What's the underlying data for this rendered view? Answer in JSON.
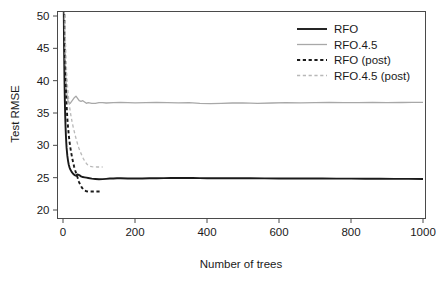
{
  "chart_data": {
    "type": "line",
    "title": "",
    "xlabel": "Number of trees",
    "ylabel": "Test RMSE",
    "xlim": [
      0,
      1000
    ],
    "ylim": [
      20,
      51
    ],
    "xticks": [
      0,
      200,
      400,
      600,
      800,
      1000
    ],
    "yticks": [
      20,
      25,
      30,
      35,
      40,
      45,
      50
    ],
    "xtick_labels": [
      "0",
      "200",
      "400",
      "600",
      "800",
      "1000"
    ],
    "ytick_labels": [
      "20",
      "25",
      "30",
      "35",
      "40",
      "45",
      "50"
    ],
    "grid": false,
    "legend_position": "top-right",
    "series": [
      {
        "name": "RFO",
        "color": "#1a1a1a",
        "style": "solid",
        "width": 1.9,
        "x": [
          1,
          2,
          3,
          4,
          5,
          6,
          7,
          8,
          9,
          10,
          12,
          14,
          16,
          18,
          20,
          24,
          28,
          32,
          36,
          40,
          45,
          50,
          55,
          60,
          65,
          70,
          80,
          90,
          100,
          110,
          120,
          130,
          140,
          150,
          160,
          180,
          200,
          220,
          240,
          260,
          280,
          300,
          320,
          340,
          360,
          380,
          400,
          440,
          480,
          520,
          560,
          600,
          640,
          680,
          720,
          760,
          800,
          840,
          880,
          920,
          960,
          1000
        ],
        "y": [
          62.5,
          52.0,
          45.0,
          40.5,
          37.2,
          34.8,
          33.0,
          31.6,
          30.5,
          29.6,
          28.4,
          27.6,
          27.0,
          26.6,
          26.3,
          25.9,
          25.6,
          25.4,
          25.3,
          25.5,
          25.4,
          25.2,
          25.1,
          25.05,
          25.0,
          24.95,
          24.85,
          24.8,
          24.75,
          24.78,
          24.82,
          24.86,
          24.88,
          24.9,
          24.9,
          24.88,
          24.87,
          24.88,
          24.9,
          24.92,
          24.93,
          24.95,
          24.96,
          24.95,
          24.94,
          24.93,
          24.92,
          24.91,
          24.9,
          24.9,
          24.89,
          24.88,
          24.88,
          24.87,
          24.86,
          24.85,
          24.85,
          24.84,
          24.83,
          24.82,
          24.81,
          24.8
        ]
      },
      {
        "name": "RFO.4.5",
        "color": "#a8a8a8",
        "style": "solid",
        "width": 1.3,
        "x": [
          1,
          2,
          3,
          4,
          5,
          6,
          7,
          8,
          9,
          10,
          12,
          14,
          16,
          18,
          20,
          24,
          28,
          32,
          36,
          40,
          45,
          50,
          55,
          60,
          65,
          70,
          80,
          90,
          100,
          110,
          120,
          140,
          160,
          180,
          200,
          230,
          260,
          290,
          320,
          350,
          380,
          410,
          440,
          470,
          500,
          540,
          580,
          620,
          660,
          700,
          740,
          780,
          820,
          860,
          900,
          940,
          970,
          1000
        ],
        "y": [
          75.0,
          63.0,
          55.0,
          49.5,
          46.0,
          43.5,
          41.6,
          40.2,
          39.2,
          38.4,
          37.4,
          36.9,
          36.6,
          36.5,
          36.5,
          36.8,
          37.1,
          37.4,
          37.6,
          37.3,
          36.9,
          36.8,
          36.9,
          36.7,
          36.5,
          36.6,
          36.5,
          36.5,
          36.6,
          36.6,
          36.55,
          36.6,
          36.62,
          36.6,
          36.58,
          36.6,
          36.62,
          36.6,
          36.58,
          36.6,
          36.5,
          36.45,
          36.5,
          36.55,
          36.58,
          36.5,
          36.55,
          36.6,
          36.58,
          36.6,
          36.62,
          36.6,
          36.6,
          36.62,
          36.6,
          36.62,
          36.63,
          36.65
        ]
      },
      {
        "name": "RFO (post)",
        "color": "#1a1a1a",
        "style": "dashed",
        "width": 1.9,
        "x": [
          1,
          2,
          3,
          4,
          5,
          6,
          7,
          8,
          9,
          10,
          12,
          14,
          16,
          18,
          20,
          22,
          25,
          28,
          31,
          34,
          37,
          40,
          44,
          48,
          52,
          56,
          60,
          65,
          70,
          75,
          80,
          85,
          90,
          95,
          100,
          105
        ],
        "y": [
          70.0,
          60.0,
          53.0,
          48.5,
          45.2,
          42.6,
          40.5,
          38.8,
          37.4,
          36.2,
          34.2,
          32.8,
          31.6,
          30.6,
          29.8,
          29.1,
          28.2,
          27.4,
          26.7,
          26.1,
          25.6,
          25.1,
          24.4,
          23.9,
          23.5,
          23.2,
          23.0,
          22.9,
          22.85,
          22.85,
          22.85,
          22.85,
          22.86,
          22.86,
          22.86,
          22.86
        ]
      },
      {
        "name": "RFO.4.5 (post)",
        "color": "#b8b8b8",
        "style": "dashed",
        "width": 1.3,
        "x": [
          1,
          2,
          3,
          4,
          5,
          6,
          7,
          8,
          9,
          10,
          12,
          14,
          16,
          18,
          20,
          22,
          25,
          28,
          31,
          34,
          37,
          40,
          44,
          48,
          52,
          56,
          60,
          65,
          70,
          75,
          80,
          85,
          90,
          95,
          100,
          105,
          110
        ],
        "y": [
          78.0,
          67.0,
          59.5,
          54.5,
          50.8,
          48.0,
          45.8,
          44.0,
          42.6,
          41.4,
          39.5,
          38.1,
          37.0,
          36.1,
          35.3,
          34.6,
          33.7,
          32.9,
          32.2,
          31.5,
          30.9,
          30.3,
          29.6,
          29.0,
          28.5,
          28.0,
          27.6,
          27.2,
          26.9,
          26.75,
          26.7,
          26.68,
          26.66,
          26.65,
          26.65,
          26.65,
          26.65
        ]
      }
    ]
  },
  "legend": {
    "entries": [
      {
        "label": "RFO"
      },
      {
        "label": "RFO.4.5"
      },
      {
        "label": "RFO (post)"
      },
      {
        "label": "RFO.4.5 (post)"
      }
    ]
  },
  "axes": {
    "x_title": "Number of trees",
    "y_title": "Test RMSE"
  }
}
